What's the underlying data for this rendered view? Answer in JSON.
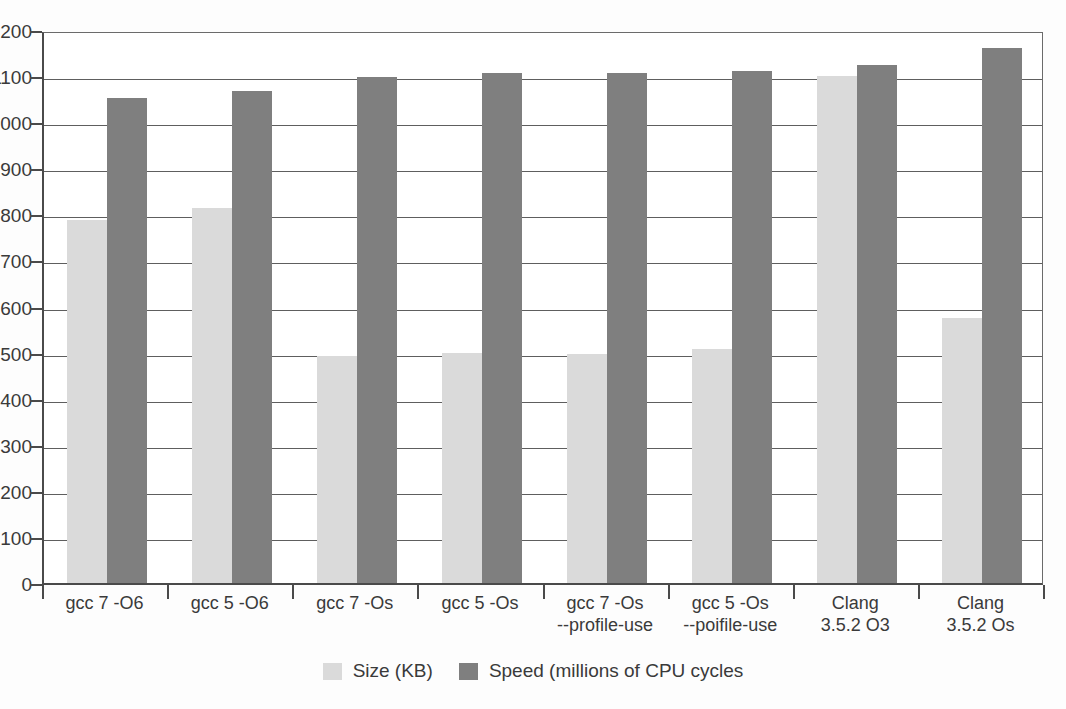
{
  "chart_data": {
    "type": "bar",
    "title": "",
    "xlabel": "",
    "ylabel": "",
    "ylim": [
      0,
      1200
    ],
    "ytick_step": 100,
    "grid": true,
    "legend_position": "bottom-center",
    "categories": [
      "gcc 7 -O6",
      "gcc 5 -O6",
      "gcc 7 -Os",
      "gcc 5 -Os",
      "gcc 7 -Os --profile-use",
      "gcc 5 -Os --poifile-use",
      "Clang 3.5.2 O3",
      "Clang 3.5.2 Os"
    ],
    "category_lines": [
      [
        "gcc 7 -O6",
        ""
      ],
      [
        "gcc 5 -O6",
        ""
      ],
      [
        "gcc 7 -Os",
        ""
      ],
      [
        "gcc 5 -Os",
        ""
      ],
      [
        "gcc 7 -Os",
        "--profile-use"
      ],
      [
        "gcc 5 -Os",
        "--poifile-use"
      ],
      [
        "Clang",
        "3.5.2 O3"
      ],
      [
        "Clang",
        "3.5.2 Os"
      ]
    ],
    "yticks": [
      0,
      100,
      200,
      300,
      400,
      500,
      600,
      700,
      800,
      900,
      1000,
      1100,
      1200
    ],
    "ytick_labels": [
      "0",
      "100",
      "200",
      "300",
      "400",
      "500",
      "600",
      "700",
      "800",
      "900",
      "1000",
      "1100",
      "1200"
    ],
    "series": [
      {
        "name": "Size (KB)",
        "color": "#dadada",
        "values": [
          788,
          813,
          493,
          500,
          497,
          508,
          1100,
          575
        ]
      },
      {
        "name": "Speed (millions of CPU cycles",
        "color": "#7f7f7f",
        "values": [
          1052,
          1068,
          1097,
          1107,
          1107,
          1110,
          1123,
          1160
        ]
      }
    ],
    "legend": [
      {
        "label": "Size (KB)",
        "color": "#dadada"
      },
      {
        "label": "Speed (millions of CPU cycles",
        "color": "#7f7f7f"
      }
    ]
  },
  "colors": {
    "size_bar": "#dadada",
    "speed_bar": "#7f7f7f",
    "axis": "#4a4a4a",
    "gridline": "#5e5e5e",
    "text": "#3a3a3a",
    "background": "#ffffff"
  }
}
